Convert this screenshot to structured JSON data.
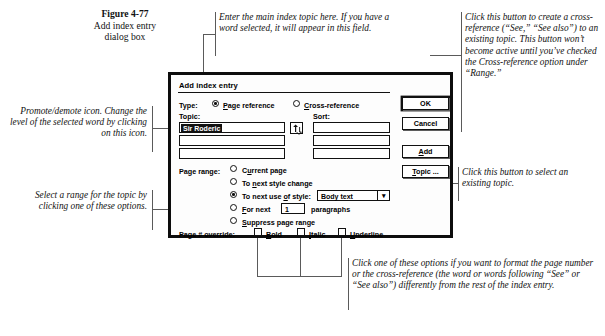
{
  "figure": {
    "number": "Figure 4-77",
    "caption_line2": "Add index entry",
    "caption_line3": "dialog box"
  },
  "annotations": {
    "topic_field": "Enter the main index topic here. If you have a word selected, it will appear in this field.",
    "cross_reference": "Click this button to create a cross-reference (“See,” “See also”) to an existing topic. This button won’t become active until you’ve checked the Cross-reference option under “Range.”",
    "promote_demote": "Promote/demote icon. Change the level of the selected word by clicking on this icon.",
    "page_range": "Select a range for the topic by clicking one of these options.",
    "topic_button": "Click this button to select an existing topic.",
    "overrides": "Click one of these options if you want to format the page number or the cross-reference (the word or words following “See” or “See also”) differently from the rest of the index entry."
  },
  "dialog": {
    "title": "Add index entry",
    "type_label": "Type:",
    "type_options": [
      {
        "label": "Page reference",
        "accel": "P",
        "selected": true
      },
      {
        "label": "Cross-reference",
        "accel": "C",
        "selected": false
      }
    ],
    "topic_label": "Topic:",
    "sort_label": "Sort:",
    "topic_value": "Sir Roderic",
    "topic_rows": [
      "",
      "",
      ""
    ],
    "sort_rows": [
      "",
      "",
      ""
    ],
    "promote_icon": "promote-demote-icon",
    "page_range_label": "Page range:",
    "page_range_options": [
      {
        "label": "Current page",
        "accel": "",
        "selected": false
      },
      {
        "label": "To next style change",
        "accel": "n",
        "selected": false
      },
      {
        "label": "To next use of style:",
        "accel": "o",
        "selected": true
      },
      {
        "label": "For next",
        "accel": "F",
        "selected": false
      },
      {
        "label": "Suppress page range",
        "accel": "S",
        "selected": false
      }
    ],
    "style_select_value": "Body text",
    "paragraphs_value": "1",
    "paragraphs_label": "paragraphs",
    "override_label": "Page # override:",
    "override_options": [
      {
        "label": "Bold",
        "accel": "B",
        "checked": false
      },
      {
        "label": "Italic",
        "accel": "I",
        "checked": false
      },
      {
        "label": "Underline",
        "accel": "U",
        "checked": false
      }
    ],
    "buttons": [
      {
        "name": "ok",
        "label": "OK",
        "default": true
      },
      {
        "name": "cancel",
        "label": "Cancel",
        "default": false
      },
      {
        "name": "add",
        "label": "Add",
        "accel": "A",
        "default": false
      },
      {
        "name": "topic",
        "label": "Topic ...",
        "accel": "T",
        "default": false
      }
    ]
  },
  "colors": {
    "ink": "#111111",
    "line": "#5a5a5a",
    "paper": "#ffffff"
  }
}
